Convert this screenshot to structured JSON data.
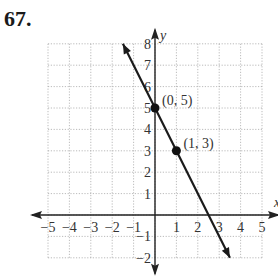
{
  "problem_number": "67.",
  "chart_data": {
    "type": "line",
    "title": "",
    "xlabel": "x",
    "ylabel": "y",
    "xlim": [
      -5,
      5
    ],
    "ylim": [
      -2,
      8
    ],
    "grid": true,
    "x_ticks": [
      "-5",
      "-4",
      "-3",
      "-2",
      "-1",
      "1",
      "2",
      "3",
      "4",
      "5"
    ],
    "y_ticks": [
      "-2",
      "-1",
      "1",
      "2",
      "3",
      "4",
      "5",
      "6",
      "7",
      "8"
    ],
    "series": [
      {
        "name": "y = -2x + 5",
        "x": [
          -1.5,
          3.5
        ],
        "y": [
          8,
          -2
        ]
      }
    ],
    "points": [
      {
        "x": 0,
        "y": 5,
        "label": "(0, 5)"
      },
      {
        "x": 1,
        "y": 3,
        "label": "(1, 3)"
      }
    ]
  }
}
